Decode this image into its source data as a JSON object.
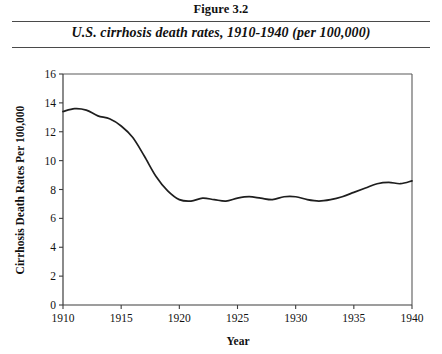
{
  "figure": {
    "number_label": "Figure 3.2",
    "subtitle": "U.S. cirrhosis death rates, 1910-1940 (per 100,000)"
  },
  "chart_data": {
    "type": "line",
    "title": "U.S. cirrhosis death rates, 1910-1940 (per 100,000)",
    "xlabel": "Year",
    "ylabel": "Cirrhosis Death Rates Per 100,000",
    "xlim": [
      1910,
      1940
    ],
    "ylim": [
      0,
      16
    ],
    "xticks": [
      1910,
      1915,
      1920,
      1925,
      1930,
      1935,
      1940
    ],
    "yticks": [
      0,
      2,
      4,
      6,
      8,
      10,
      12,
      14,
      16
    ],
    "xtick_labels": [
      "1910",
      "1915",
      "1920",
      "1925",
      "1930",
      "1935",
      "1940"
    ],
    "ytick_labels": [
      "0",
      "2",
      "4",
      "6",
      "8",
      "10",
      "12",
      "14",
      "16"
    ],
    "grid": false,
    "legend": "none",
    "line_color": "#1e1e1e",
    "x": [
      1910,
      1911,
      1912,
      1913,
      1914,
      1915,
      1916,
      1917,
      1918,
      1919,
      1920,
      1921,
      1922,
      1923,
      1924,
      1925,
      1926,
      1927,
      1928,
      1929,
      1930,
      1931,
      1932,
      1933,
      1934,
      1935,
      1936,
      1937,
      1938,
      1939,
      1940
    ],
    "values": [
      13.4,
      13.6,
      13.5,
      13.1,
      12.9,
      12.4,
      11.6,
      10.3,
      8.9,
      7.9,
      7.3,
      7.2,
      7.4,
      7.3,
      7.2,
      7.4,
      7.5,
      7.4,
      7.3,
      7.5,
      7.5,
      7.3,
      7.2,
      7.3,
      7.5,
      7.8,
      8.1,
      8.4,
      8.5,
      8.4,
      8.6
    ]
  }
}
